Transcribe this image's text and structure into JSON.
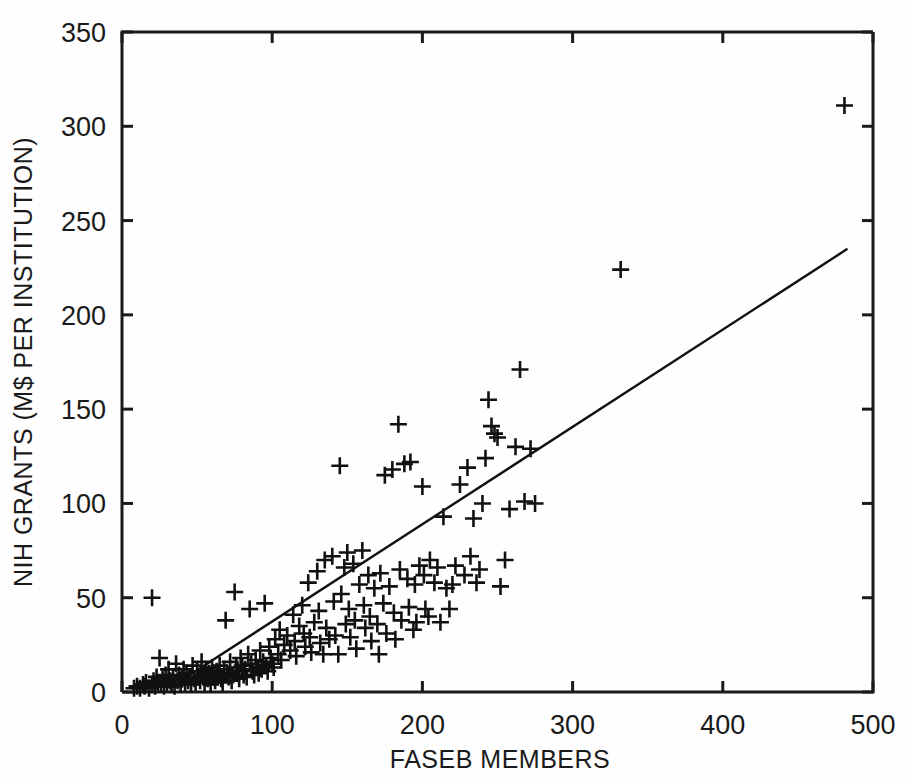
{
  "chart_data": {
    "type": "scatter",
    "title": "",
    "xlabel": "FASEB MEMBERS",
    "ylabel": "NIH GRANTS (M$ PER INSTITUTION)",
    "xlim": [
      0,
      500
    ],
    "ylim": [
      0,
      350
    ],
    "xticks": [
      0,
      100,
      200,
      300,
      400,
      500
    ],
    "yticks": [
      0,
      50,
      100,
      150,
      200,
      250,
      300,
      350
    ],
    "xtick_labels": [
      "0",
      "100",
      "200",
      "300",
      "400",
      "500"
    ],
    "ytick_labels": [
      "0",
      "50",
      "100",
      "150",
      "200",
      "250",
      "300",
      "350"
    ],
    "grid": false,
    "legend": null,
    "marker_style": "plus",
    "marker_color": "#111111",
    "series": [
      {
        "name": "institutions",
        "points": [
          [
            8,
            2
          ],
          [
            10,
            3
          ],
          [
            12,
            2
          ],
          [
            14,
            4
          ],
          [
            15,
            3
          ],
          [
            16,
            5
          ],
          [
            18,
            2
          ],
          [
            20,
            50
          ],
          [
            20,
            4
          ],
          [
            21,
            6
          ],
          [
            22,
            3
          ],
          [
            23,
            8
          ],
          [
            24,
            5
          ],
          [
            25,
            18
          ],
          [
            26,
            4
          ],
          [
            27,
            7
          ],
          [
            28,
            3
          ],
          [
            29,
            9
          ],
          [
            30,
            5
          ],
          [
            31,
            12
          ],
          [
            32,
            6
          ],
          [
            33,
            4
          ],
          [
            34,
            8
          ],
          [
            35,
            3
          ],
          [
            36,
            15
          ],
          [
            37,
            6
          ],
          [
            38,
            9
          ],
          [
            39,
            4
          ],
          [
            40,
            7
          ],
          [
            41,
            12
          ],
          [
            42,
            5
          ],
          [
            43,
            10
          ],
          [
            44,
            6
          ],
          [
            45,
            8
          ],
          [
            46,
            4
          ],
          [
            47,
            14
          ],
          [
            48,
            7
          ],
          [
            49,
            5
          ],
          [
            50,
            11
          ],
          [
            51,
            8
          ],
          [
            52,
            6
          ],
          [
            53,
            16
          ],
          [
            54,
            9
          ],
          [
            55,
            5
          ],
          [
            56,
            12
          ],
          [
            57,
            7
          ],
          [
            58,
            10
          ],
          [
            59,
            4
          ],
          [
            60,
            13
          ],
          [
            61,
            8
          ],
          [
            62,
            6
          ],
          [
            63,
            11
          ],
          [
            64,
            9
          ],
          [
            65,
            14
          ],
          [
            66,
            7
          ],
          [
            67,
            5
          ],
          [
            68,
            12
          ],
          [
            69,
            38
          ],
          [
            70,
            10
          ],
          [
            71,
            8
          ],
          [
            72,
            16
          ],
          [
            73,
            6
          ],
          [
            74,
            9
          ],
          [
            75,
            53
          ],
          [
            76,
            13
          ],
          [
            77,
            11
          ],
          [
            78,
            7
          ],
          [
            79,
            18
          ],
          [
            80,
            14
          ],
          [
            81,
            9
          ],
          [
            82,
            12
          ],
          [
            83,
            8
          ],
          [
            84,
            20
          ],
          [
            85,
            44
          ],
          [
            86,
            15
          ],
          [
            87,
            11
          ],
          [
            88,
            9
          ],
          [
            89,
            17
          ],
          [
            90,
            13
          ],
          [
            91,
            10
          ],
          [
            92,
            22
          ],
          [
            93,
            12
          ],
          [
            94,
            16
          ],
          [
            95,
            47
          ],
          [
            96,
            14
          ],
          [
            97,
            11
          ],
          [
            98,
            24
          ],
          [
            99,
            18
          ],
          [
            100,
            15
          ],
          [
            101,
            13
          ],
          [
            102,
            28
          ],
          [
            104,
            20
          ],
          [
            105,
            33
          ],
          [
            106,
            17
          ],
          [
            108,
            25
          ],
          [
            110,
            30
          ],
          [
            112,
            22
          ],
          [
            114,
            41
          ],
          [
            115,
            27
          ],
          [
            116,
            19
          ],
          [
            118,
            35
          ],
          [
            120,
            46
          ],
          [
            121,
            31
          ],
          [
            122,
            24
          ],
          [
            124,
            58
          ],
          [
            125,
            29
          ],
          [
            126,
            21
          ],
          [
            128,
            37
          ],
          [
            130,
            64
          ],
          [
            131,
            43
          ],
          [
            132,
            26
          ],
          [
            134,
            20
          ],
          [
            135,
            70
          ],
          [
            136,
            34
          ],
          [
            138,
            28
          ],
          [
            140,
            72
          ],
          [
            141,
            48
          ],
          [
            142,
            30
          ],
          [
            144,
            20
          ],
          [
            145,
            120
          ],
          [
            146,
            52
          ],
          [
            148,
            66
          ],
          [
            149,
            36
          ],
          [
            150,
            74
          ],
          [
            151,
            44
          ],
          [
            152,
            29
          ],
          [
            154,
            68
          ],
          [
            155,
            38
          ],
          [
            156,
            23
          ],
          [
            158,
            57
          ],
          [
            160,
            75
          ],
          [
            161,
            46
          ],
          [
            162,
            34
          ],
          [
            164,
            62
          ],
          [
            165,
            40
          ],
          [
            166,
            27
          ],
          [
            168,
            55
          ],
          [
            170,
            36
          ],
          [
            171,
            20
          ],
          [
            172,
            63
          ],
          [
            174,
            47
          ],
          [
            175,
            115
          ],
          [
            176,
            31
          ],
          [
            178,
            56
          ],
          [
            180,
            118
          ],
          [
            181,
            42
          ],
          [
            182,
            28
          ],
          [
            184,
            142
          ],
          [
            185,
            65
          ],
          [
            186,
            38
          ],
          [
            188,
            121
          ],
          [
            190,
            60
          ],
          [
            191,
            45
          ],
          [
            192,
            122
          ],
          [
            194,
            33
          ],
          [
            195,
            57
          ],
          [
            196,
            37
          ],
          [
            198,
            67
          ],
          [
            200,
            109
          ],
          [
            201,
            62
          ],
          [
            202,
            44
          ],
          [
            204,
            40
          ],
          [
            205,
            70
          ],
          [
            208,
            58
          ],
          [
            210,
            66
          ],
          [
            212,
            37
          ],
          [
            214,
            93
          ],
          [
            216,
            55
          ],
          [
            218,
            44
          ],
          [
            220,
            57
          ],
          [
            222,
            67
          ],
          [
            225,
            110
          ],
          [
            228,
            62
          ],
          [
            230,
            119
          ],
          [
            232,
            72
          ],
          [
            234,
            92
          ],
          [
            236,
            58
          ],
          [
            238,
            65
          ],
          [
            240,
            100
          ],
          [
            242,
            124
          ],
          [
            244,
            155
          ],
          [
            246,
            141
          ],
          [
            248,
            137
          ],
          [
            250,
            135
          ],
          [
            252,
            56
          ],
          [
            255,
            70
          ],
          [
            258,
            97
          ],
          [
            262,
            130
          ],
          [
            265,
            171
          ],
          [
            268,
            101
          ],
          [
            272,
            129
          ],
          [
            275,
            100
          ],
          [
            332,
            224
          ],
          [
            481,
            311
          ]
        ]
      }
    ],
    "fit_line": {
      "name": "regression-line",
      "x1": 45,
      "y1": 9,
      "x2": 483,
      "y2": 235
    }
  }
}
